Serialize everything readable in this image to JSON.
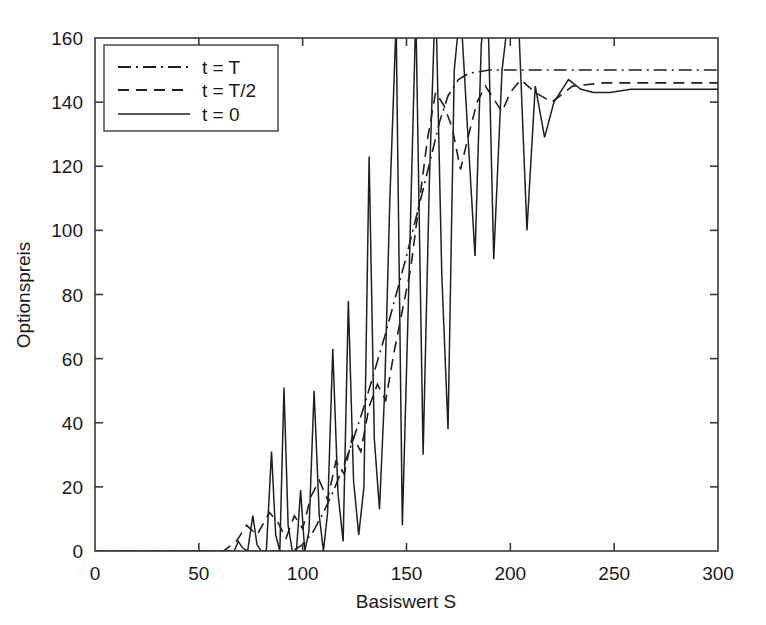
{
  "chart_data": {
    "type": "line",
    "title": "",
    "xlabel": "Basiswert S",
    "ylabel": "Optionspreis",
    "xlim": [
      0,
      300
    ],
    "ylim": [
      0,
      160
    ],
    "xticks": [
      0,
      50,
      100,
      150,
      200,
      250,
      300
    ],
    "yticks": [
      0,
      20,
      40,
      60,
      80,
      100,
      120,
      140,
      160
    ],
    "xtick_labels": [
      "0",
      "50",
      "100",
      "150",
      "200",
      "250",
      "300"
    ],
    "ytick_labels": [
      "0",
      "20",
      "40",
      "60",
      "80",
      "100",
      "120",
      "140",
      "160"
    ],
    "grid": false,
    "legend_position": "upper-left",
    "legend_entries": [
      "t = T",
      "t = T/2",
      "t = 0"
    ],
    "series": [
      {
        "name": "t = T",
        "label": "t = T",
        "linestyle": "dashdot",
        "color": "#1f1f1f",
        "x": [
          0,
          30,
          60,
          80,
          95,
          100,
          105,
          110,
          115,
          120,
          125,
          130,
          135,
          140,
          145,
          150,
          155,
          160,
          163,
          166,
          170,
          175,
          180,
          190,
          200,
          220,
          250,
          300
        ],
        "y": [
          0,
          0,
          0,
          0,
          0,
          2,
          6,
          12,
          19,
          27,
          36,
          46,
          57,
          68,
          80,
          92,
          105,
          118,
          126,
          134,
          142,
          147,
          149,
          150,
          150,
          150,
          150,
          150
        ]
      },
      {
        "name": "t = T/2",
        "label": "t = T/2",
        "linestyle": "dashed",
        "color": "#1f1f1f",
        "x": [
          0,
          40,
          62,
          68,
          73,
          78,
          84,
          88,
          92,
          96,
          100,
          104,
          108,
          112,
          116,
          120,
          124,
          128,
          132,
          136,
          140,
          144,
          148,
          152,
          156,
          160,
          164,
          168,
          172,
          176,
          180,
          184,
          188,
          192,
          196,
          200,
          205,
          212,
          220,
          230,
          245,
          265,
          285,
          300
        ],
        "y": [
          0,
          0,
          0,
          3,
          8,
          5,
          12,
          9,
          4,
          11,
          7,
          17,
          22,
          16,
          28,
          24,
          36,
          31,
          45,
          52,
          47,
          62,
          75,
          88,
          108,
          128,
          143,
          139,
          132,
          119,
          130,
          140,
          145,
          141,
          137,
          143,
          147,
          143,
          140,
          145,
          146,
          146,
          146,
          146
        ]
      },
      {
        "name": "t = 0",
        "label": "t = 0",
        "linestyle": "solid",
        "color": "#1f1f1f",
        "x": [
          0,
          20,
          40,
          55,
          62,
          64.5,
          67,
          69,
          71,
          73.5,
          76,
          78,
          80,
          82.5,
          85,
          87,
          89,
          91,
          93,
          95,
          97,
          99,
          101,
          103,
          105.5,
          108,
          110,
          112,
          114.5,
          117,
          119.5,
          122,
          124.5,
          127,
          129.5,
          132,
          134.5,
          137,
          139.5,
          142,
          145,
          148,
          151,
          154.5,
          158,
          161,
          164,
          167,
          170,
          173,
          176,
          180,
          183,
          186,
          189,
          192,
          196,
          200,
          204,
          208,
          212,
          216.5,
          221,
          228,
          234,
          240,
          248,
          258,
          270,
          285,
          300
        ],
        "y": [
          0,
          0,
          0,
          0,
          0,
          0,
          0,
          3,
          1,
          0,
          11,
          2,
          0,
          0,
          31,
          5,
          0,
          51,
          8,
          0,
          0,
          19,
          0,
          6,
          50,
          11,
          0,
          12,
          63,
          18,
          3,
          78,
          22,
          5,
          20,
          123,
          35,
          13,
          50,
          110,
          165,
          8,
          80,
          168,
          30,
          115,
          175,
          86,
          38,
          150,
          170,
          125,
          92,
          158,
          175,
          91,
          150,
          172,
          165,
          100,
          145,
          129,
          140,
          147,
          144,
          143,
          143,
          144,
          144,
          144,
          144
        ]
      }
    ]
  },
  "axes": {
    "ylabel": "Optionspreis",
    "xlabel": "Basiswert S"
  }
}
